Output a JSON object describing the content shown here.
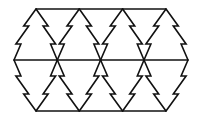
{
  "diagram": {
    "type": "tessellation",
    "width": 199,
    "height": 120,
    "stroke_color": "#111111",
    "stroke_width": 1.6,
    "background": "#ffffff",
    "levels": {
      "top_y": 9,
      "middle_y": 60,
      "bottom_y": 111
    },
    "apex_x": [
      36,
      79.3,
      122.6,
      166
    ],
    "middle_x": [
      14,
      57.3,
      100.6,
      144,
      188
    ],
    "horizontal_lines": [
      {
        "name": "top-line",
        "x1": 36,
        "x2": 166,
        "y": 9
      },
      {
        "name": "middle-line",
        "x1": 14,
        "x2": 188,
        "y": 60
      },
      {
        "name": "bottom-line",
        "x1": 36,
        "x2": 166,
        "y": 111
      }
    ],
    "notch": {
      "count": 2,
      "step": 5,
      "fractions": [
        0.333,
        0.686
      ]
    }
  }
}
